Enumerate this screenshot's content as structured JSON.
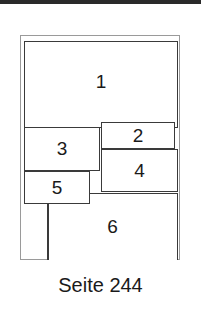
{
  "diagram": {
    "boxes": [
      {
        "id": "1",
        "label": "1"
      },
      {
        "id": "2",
        "label": "2"
      },
      {
        "id": "3",
        "label": "3"
      },
      {
        "id": "4",
        "label": "4"
      },
      {
        "id": "5",
        "label": "5"
      },
      {
        "id": "6",
        "label": "6"
      }
    ],
    "caption": "Seite 244"
  }
}
